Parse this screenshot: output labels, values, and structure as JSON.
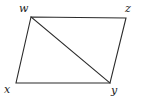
{
  "figure": {
    "name": "quadrilateral-with-diagonal",
    "background_color": "#ffffff",
    "stroke_color": "#2b2b2b",
    "stroke_width": 1.1,
    "width": 141,
    "height": 102,
    "labels": {
      "w": "w",
      "x": "x",
      "y": "y",
      "z": "z"
    },
    "vertices": [
      {
        "id": "w",
        "label": "w",
        "x": 31,
        "y": 17
      },
      {
        "id": "z",
        "label": "z",
        "x": 126,
        "y": 18
      },
      {
        "id": "y",
        "label": "y",
        "x": 110,
        "y": 83
      },
      {
        "id": "x",
        "label": "x",
        "x": 16,
        "y": 83
      }
    ],
    "edges": [
      {
        "id": "edge-wz",
        "from": "w",
        "to": "z",
        "kind": "side"
      },
      {
        "id": "edge-zy",
        "from": "z",
        "to": "y",
        "kind": "side"
      },
      {
        "id": "edge-yx",
        "from": "y",
        "to": "x",
        "kind": "side"
      },
      {
        "id": "edge-xw",
        "from": "x",
        "to": "w",
        "kind": "side"
      },
      {
        "id": "edge-wy",
        "from": "w",
        "to": "y",
        "kind": "diagonal"
      }
    ],
    "outline_path": "M 31 17 L 126 18 L 110 83 L 16 83 Z",
    "diagonal_path": "M 31 17 L 110 83"
  }
}
